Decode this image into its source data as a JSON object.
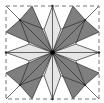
{
  "diagram": {
    "type": "crease-pattern",
    "colors": {
      "background": "#ffffff",
      "dark": "#7f7f7f",
      "light": "#e6e6e6",
      "line": "#2b2b2b",
      "border": "#777777",
      "center_dot": "#000000"
    },
    "square": {
      "x": 6,
      "y": 6,
      "size": 93
    },
    "dark_regions": [
      [
        [
          28,
          0
        ],
        [
          50,
          50
        ],
        [
          0,
          28
        ],
        [
          15,
          15
        ]
      ],
      [
        [
          72,
          0
        ],
        [
          50,
          50
        ],
        [
          100,
          28
        ],
        [
          85,
          15
        ]
      ],
      [
        [
          28,
          100
        ],
        [
          50,
          50
        ],
        [
          0,
          72
        ],
        [
          15,
          85
        ]
      ],
      [
        [
          72,
          100
        ],
        [
          50,
          50
        ],
        [
          100,
          72
        ],
        [
          85,
          85
        ]
      ]
    ],
    "light_regions": [
      [
        [
          50,
          0
        ],
        [
          41,
          25
        ],
        [
          50,
          50
        ],
        [
          59,
          25
        ]
      ],
      [
        [
          100,
          50
        ],
        [
          75,
          41
        ],
        [
          50,
          50
        ],
        [
          75,
          59
        ]
      ],
      [
        [
          50,
          100
        ],
        [
          41,
          75
        ],
        [
          50,
          50
        ],
        [
          59,
          75
        ]
      ],
      [
        [
          0,
          50
        ],
        [
          25,
          41
        ],
        [
          50,
          50
        ],
        [
          25,
          59
        ]
      ]
    ],
    "creases": [
      [
        [
          0,
          0
        ],
        [
          100,
          100
        ]
      ],
      [
        [
          100,
          0
        ],
        [
          0,
          100
        ]
      ],
      [
        [
          50,
          0
        ],
        [
          50,
          100
        ]
      ],
      [
        [
          0,
          50
        ],
        [
          100,
          50
        ]
      ],
      [
        [
          28,
          0
        ],
        [
          50,
          50
        ]
      ],
      [
        [
          72,
          0
        ],
        [
          50,
          50
        ]
      ],
      [
        [
          28,
          100
        ],
        [
          50,
          50
        ]
      ],
      [
        [
          72,
          100
        ],
        [
          50,
          50
        ]
      ],
      [
        [
          0,
          28
        ],
        [
          50,
          50
        ]
      ],
      [
        [
          0,
          72
        ],
        [
          50,
          50
        ]
      ],
      [
        [
          100,
          28
        ],
        [
          50,
          50
        ]
      ],
      [
        [
          100,
          72
        ],
        [
          50,
          50
        ]
      ],
      [
        [
          50,
          0
        ],
        [
          41,
          25
        ]
      ],
      [
        [
          50,
          0
        ],
        [
          59,
          25
        ]
      ],
      [
        [
          41,
          25
        ],
        [
          50,
          50
        ]
      ],
      [
        [
          59,
          25
        ],
        [
          50,
          50
        ]
      ],
      [
        [
          50,
          100
        ],
        [
          41,
          75
        ]
      ],
      [
        [
          50,
          100
        ],
        [
          59,
          75
        ]
      ],
      [
        [
          41,
          75
        ],
        [
          50,
          50
        ]
      ],
      [
        [
          59,
          75
        ],
        [
          50,
          50
        ]
      ],
      [
        [
          0,
          50
        ],
        [
          25,
          41
        ]
      ],
      [
        [
          0,
          50
        ],
        [
          25,
          59
        ]
      ],
      [
        [
          25,
          41
        ],
        [
          50,
          50
        ]
      ],
      [
        [
          25,
          59
        ],
        [
          50,
          50
        ]
      ],
      [
        [
          100,
          50
        ],
        [
          75,
          41
        ]
      ],
      [
        [
          100,
          50
        ],
        [
          75,
          59
        ]
      ],
      [
        [
          75,
          41
        ],
        [
          50,
          50
        ]
      ],
      [
        [
          75,
          59
        ],
        [
          50,
          50
        ]
      ],
      [
        [
          15,
          15
        ],
        [
          41,
          25
        ]
      ],
      [
        [
          15,
          15
        ],
        [
          25,
          41
        ]
      ],
      [
        [
          85,
          15
        ],
        [
          59,
          25
        ]
      ],
      [
        [
          85,
          15
        ],
        [
          75,
          41
        ]
      ],
      [
        [
          15,
          85
        ],
        [
          41,
          75
        ]
      ],
      [
        [
          15,
          85
        ],
        [
          25,
          59
        ]
      ],
      [
        [
          85,
          85
        ],
        [
          59,
          75
        ]
      ],
      [
        [
          85,
          85
        ],
        [
          75,
          59
        ]
      ],
      [
        [
          28,
          0
        ],
        [
          15,
          15
        ]
      ],
      [
        [
          0,
          28
        ],
        [
          15,
          15
        ]
      ],
      [
        [
          72,
          0
        ],
        [
          85,
          15
        ]
      ],
      [
        [
          100,
          28
        ],
        [
          85,
          15
        ]
      ],
      [
        [
          28,
          100
        ],
        [
          15,
          85
        ]
      ],
      [
        [
          0,
          72
        ],
        [
          15,
          85
        ]
      ],
      [
        [
          72,
          100
        ],
        [
          85,
          85
        ]
      ],
      [
        [
          100,
          72
        ],
        [
          85,
          85
        ]
      ]
    ],
    "vertices": [
      [
        15,
        15
      ],
      [
        85,
        15
      ],
      [
        15,
        85
      ],
      [
        85,
        85
      ],
      [
        50,
        0
      ],
      [
        100,
        50
      ],
      [
        50,
        100
      ],
      [
        0,
        50
      ]
    ]
  }
}
